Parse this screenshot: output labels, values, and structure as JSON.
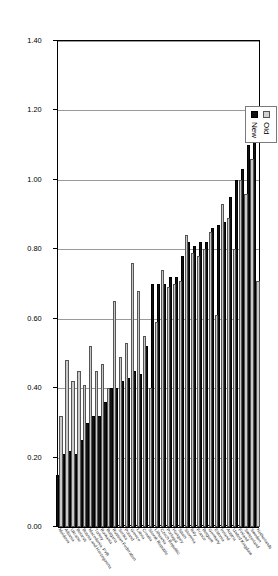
{
  "chart_data": {
    "type": "bar",
    "orientation": "horizontal",
    "title": "",
    "subtitle": "",
    "xlabel": "",
    "ylabel": "",
    "xlim": [
      0.0,
      1.4
    ],
    "xticks": [
      "0.00",
      "0.20",
      "0.40",
      "0.60",
      "0.80",
      "1.00",
      "1.20",
      "1.40"
    ],
    "xtick_values": [
      0.0,
      0.2,
      0.4,
      0.6,
      0.8,
      1.0,
      1.2,
      1.4
    ],
    "grid": true,
    "grid_axis": "x",
    "legend_position": "top-right",
    "categories": [
      "Netherlands",
      "Sweden",
      "Switzerland",
      "Finland",
      "United Kingdom",
      "Austria",
      "Ireland",
      "Estonia",
      "Germany",
      "Belgium",
      "France",
      "Italy",
      "Slovenia",
      "Spain",
      "Hungary",
      "Portugal",
      "Czech Republic",
      "Lithuania",
      "Slovak Republic",
      "Croatia",
      "Latvia",
      "Greece",
      "Poland",
      "Serbia",
      "Russian Federation",
      "Bulgaria",
      "Romania",
      "Turkey",
      "Macedonia, FYR",
      "Bosnia and Herzegovina",
      "Belarus",
      "Ukraine",
      "Albania",
      "Moldova"
    ],
    "series": [
      {
        "name": "Old",
        "color": "#c9c9c9",
        "values": [
          0.71,
          1.06,
          0.96,
          1.0,
          0.8,
          0.89,
          0.93,
          0.61,
          0.85,
          0.8,
          0.78,
          0.79,
          0.84,
          0.71,
          0.7,
          0.69,
          0.74,
          0.59,
          0.4,
          0.55,
          0.68,
          0.76,
          0.53,
          0.49,
          0.65,
          0.4,
          0.47,
          0.45,
          0.52,
          0.41,
          0.45,
          0.42,
          0.48,
          0.32
        ]
      },
      {
        "name": "New",
        "color": "#111111",
        "values": [
          1.15,
          1.1,
          1.03,
          1.0,
          0.95,
          0.88,
          0.87,
          0.86,
          0.82,
          0.82,
          0.81,
          0.82,
          0.78,
          0.72,
          0.72,
          0.7,
          0.7,
          0.7,
          0.52,
          0.44,
          0.45,
          0.43,
          0.42,
          0.4,
          0.4,
          0.36,
          0.32,
          0.32,
          0.3,
          0.25,
          0.21,
          0.22,
          0.21,
          0.15
        ]
      }
    ]
  },
  "legend": {
    "items": [
      {
        "label": "Old",
        "series_key": "old"
      },
      {
        "label": "New",
        "series_key": "new"
      }
    ]
  }
}
